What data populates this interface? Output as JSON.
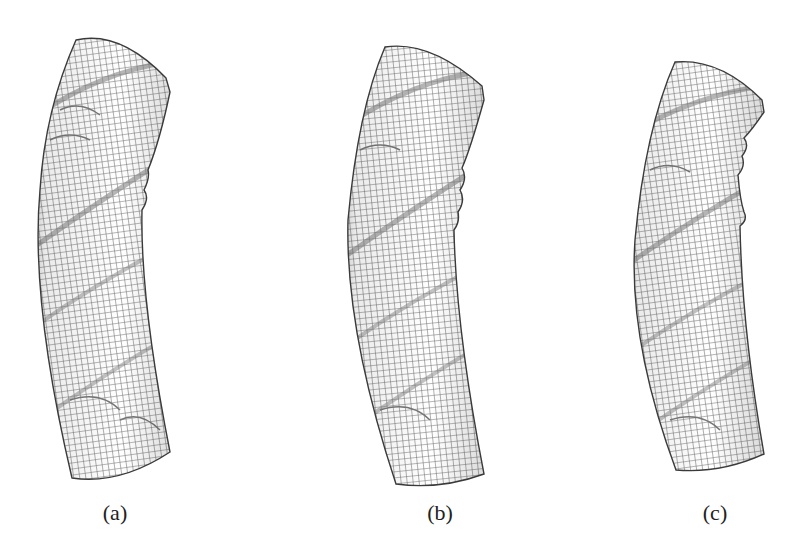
{
  "figure": {
    "panels": [
      {
        "label": "(a)",
        "label_x": 115,
        "description": "Buckled tube mesh with helical wrinkles, variant a",
        "outline": "M76,40 Q120,30 166,78 L170,92 Q160,140 148,170 Q150,178 144,190 Q150,198 142,210 Q140,300 170,452 Q120,485 72,478 Q30,300 40,190 Q45,110 76,40 Z"
      },
      {
        "label": "(b)",
        "label_x": 440,
        "description": "Buckled tube mesh with helical wrinkles, variant b",
        "outline": "M385,47 Q430,40 482,86 L484,100 Q470,150 462,168 Q468,178 460,190 Q466,200 458,212 Q460,222 454,230 Q456,330 484,474 Q440,490 396,484 Q345,330 348,220 Q358,110 385,47 Z"
      },
      {
        "label": "(c)",
        "label_x": 715,
        "description": "Buckled tube mesh with helical wrinkles, variant c",
        "outline": "M675,62 Q720,58 762,100 L764,112 Q752,130 744,138 Q750,146 742,156 Q746,166 738,175 Q740,200 744,212 Q748,220 740,226 Q742,330 764,454 Q720,474 676,470 Q628,340 635,240 Q645,130 675,62 Z"
      }
    ],
    "colors": {
      "mesh_line": "#6e6e6e",
      "outline": "#3a3a3a",
      "background": "#ffffff",
      "band": "#8a8a8a"
    }
  }
}
